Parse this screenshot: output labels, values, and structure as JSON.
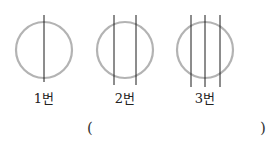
{
  "figures": [
    {
      "label": "1번",
      "cx": 44,
      "cy": 50,
      "r": 28,
      "lines_x": [
        44
      ],
      "line_top": 15,
      "line_bottom": 82
    },
    {
      "label": "2번",
      "cx": 125,
      "cy": 50,
      "r": 28,
      "lines_x": [
        114,
        136
      ],
      "line_top": 15,
      "line_bottom": 85
    },
    {
      "label": "3번",
      "cx": 205,
      "cy": 50,
      "r": 28,
      "lines_x": [
        191,
        205,
        220
      ],
      "line_top": 15,
      "line_bottom": 87
    }
  ],
  "answer_blank": {
    "open": "(",
    "close": ")"
  },
  "colors": {
    "circle": "#b3b3b3",
    "line": "#1a1a1a"
  }
}
